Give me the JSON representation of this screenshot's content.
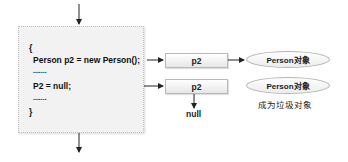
{
  "code_block": {
    "lines": [
      "{",
      "Person p2 = new Person();",
      ".......",
      "P2 = null;",
      ".......",
      "}"
    ]
  },
  "references": [
    {
      "label": "p2"
    },
    {
      "label": "p2"
    }
  ],
  "objects": [
    {
      "label": "Person对象"
    },
    {
      "label": "Person对象"
    }
  ],
  "null_label": "null",
  "garbage_label": "成为垃圾对象",
  "colors": {
    "code_bg": "#f2f2f2",
    "border": "#b8b8b8",
    "arrow": "#222222"
  }
}
